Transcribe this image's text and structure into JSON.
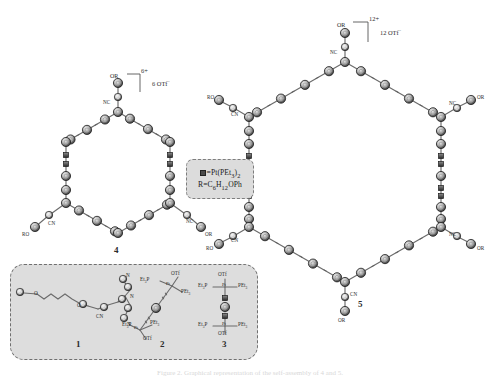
{
  "figure": {
    "background": "#ffffff",
    "caption_faint": "Figure 2. Graphical representation of the self-assembly of 4 and 5.",
    "legend": {
      "box_fill": "#dcdcdc",
      "line1_symbol": "square-marker",
      "line1_text": "=Pt(PEt3)2",
      "line1_rich": "=Pt(PEt",
      "line1_sub": "3",
      "line1_tail": ")",
      "line1_sub2": "2",
      "line2_head": "R=C",
      "line2_sub1": "6",
      "line2_mid": "H",
      "line2_sub2": "12",
      "line2_tail": "OPh"
    }
  },
  "structures": {
    "four": {
      "id": "4",
      "charge": "6+",
      "counterion": "6 OTf",
      "counterion_sup": "−",
      "arm_labels": [
        {
          "name": "OR",
          "text": "OR"
        },
        {
          "name": "NC",
          "text": "NC"
        },
        {
          "name": "RO",
          "text": "RO"
        },
        {
          "name": "CN",
          "text": "CN"
        },
        {
          "name": "NC-right",
          "text": "NC"
        },
        {
          "name": "OR-right",
          "text": "OR"
        }
      ]
    },
    "five": {
      "id": "5",
      "charge": "12+",
      "counterion": "12 OTf",
      "counterion_sup": "−",
      "arm_labels": [
        {
          "name": "OR-top",
          "text": "OR"
        },
        {
          "name": "NC-top",
          "text": "NC"
        },
        {
          "name": "RO-upper-left",
          "text": "RO"
        },
        {
          "name": "CN-upper-left",
          "text": "CN"
        },
        {
          "name": "NC-upper-right",
          "text": "NC"
        },
        {
          "name": "OR-upper-right",
          "text": "OR"
        },
        {
          "name": "RO-lower-left",
          "text": "RO"
        },
        {
          "name": "CN-lower-left",
          "text": "CN"
        },
        {
          "name": "NC-lower-right",
          "text": "NC"
        },
        {
          "name": "OR-lower-right",
          "text": "OR"
        },
        {
          "name": "CN-bottom",
          "text": "CN"
        },
        {
          "name": "OR-bottom",
          "text": "OR"
        }
      ]
    },
    "one": {
      "id": "1",
      "labels": [
        {
          "name": "CN",
          "text": "CN"
        },
        {
          "name": "N-apex",
          "text": "N"
        },
        {
          "name": "N-pyridyl-upper",
          "text": "N"
        },
        {
          "name": "N-pyridyl-lower",
          "text": "N"
        },
        {
          "name": "O-ether-left",
          "text": "O"
        },
        {
          "name": "O-ether-right",
          "text": "O"
        }
      ]
    },
    "two": {
      "id": "2",
      "labels": [
        {
          "name": "Et3P-upper",
          "text": "Et3P"
        },
        {
          "name": "OTf-upper",
          "text": "OTf"
        },
        {
          "name": "PEt3-upper",
          "text": "PEt3"
        },
        {
          "name": "Et3P-lower",
          "text": "Et3P"
        },
        {
          "name": "OTf-lower",
          "text": "OTf"
        },
        {
          "name": "PEt3-lower",
          "text": "PEt3"
        },
        {
          "name": "Pt-upper",
          "text": "Pt"
        },
        {
          "name": "Pt-lower",
          "text": "Pt"
        }
      ]
    },
    "three": {
      "id": "3",
      "labels": [
        {
          "name": "OTf-top",
          "text": "OTf"
        },
        {
          "name": "Et3P-top",
          "text": "Et3P"
        },
        {
          "name": "PEt3-top",
          "text": "PEt3"
        },
        {
          "name": "Pt-top",
          "text": "Pt"
        },
        {
          "name": "Et3P-bottom",
          "text": "Et3P"
        },
        {
          "name": "PEt3-bottom",
          "text": "PEt3"
        },
        {
          "name": "Pt-bottom",
          "text": "Pt"
        },
        {
          "name": "OTf-bottom",
          "text": "OTf"
        }
      ]
    }
  },
  "colors": {
    "ring_outer": "#3b3b3b",
    "ring_inner": "#9a9a9a",
    "bond": "#6b6b6b",
    "pt_square": "#4a4a4a",
    "box_border": "#6f6f6f",
    "box_fill": "#dddddd"
  }
}
